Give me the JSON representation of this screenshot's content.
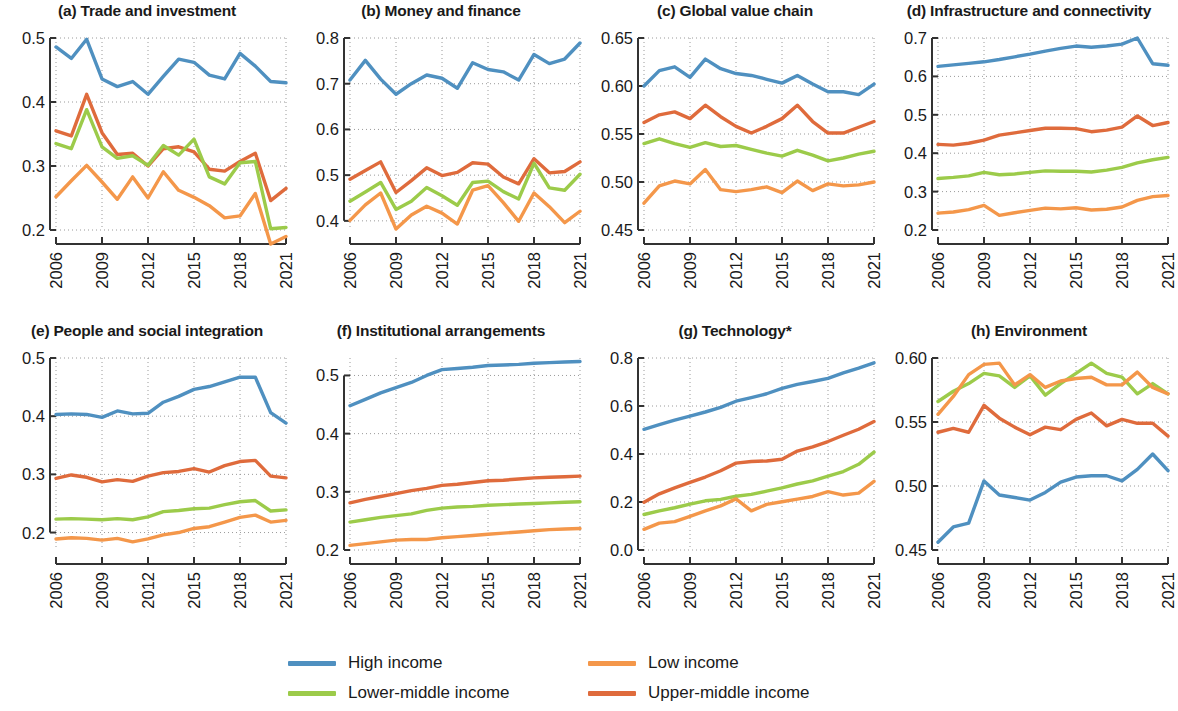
{
  "figure": {
    "background": "#ffffff",
    "x_ticks": [
      "2006",
      "2009",
      "2012",
      "2015",
      "2018",
      "2021"
    ],
    "years": [
      2006,
      2007,
      2008,
      2009,
      2010,
      2011,
      2012,
      2013,
      2014,
      2015,
      2016,
      2017,
      2018,
      2019,
      2020,
      2021
    ]
  },
  "legend": {
    "position": "bottom-center",
    "items": [
      {
        "label": "High income",
        "color": "#4f90c0"
      },
      {
        "label": "Low income",
        "color": "#f4974a"
      },
      {
        "label": "Lower-middle income",
        "color": "#9ccb4a"
      },
      {
        "label": "Upper-middle income",
        "color": "#df6b3c"
      }
    ]
  },
  "colors": {
    "high_income": "#4f90c0",
    "low_income": "#f4974a",
    "lower_middle_income": "#9ccb4a",
    "upper_middle_income": "#df6b3c",
    "axis": "#333333",
    "grid": "#9a9a9a"
  },
  "chart_data": [
    {
      "type": "line",
      "panel": "a",
      "title": "(a) Trade and investment",
      "xlabel": "",
      "ylabel": "",
      "x": [
        2006,
        2007,
        2008,
        2009,
        2010,
        2011,
        2012,
        2013,
        2014,
        2015,
        2016,
        2017,
        2018,
        2019,
        2020,
        2021
      ],
      "ylim": [
        0.2,
        0.5
      ],
      "yticks": [
        0.2,
        0.3,
        0.4,
        0.5
      ],
      "ytick_labels": [
        "0.2",
        "0.3",
        "0.4",
        "0.5"
      ],
      "grid": true,
      "series": [
        {
          "name": "High income",
          "color": "#4f90c0",
          "values": [
            0.486,
            0.468,
            0.498,
            0.436,
            0.424,
            0.432,
            0.412,
            0.44,
            0.467,
            0.462,
            0.442,
            0.436,
            0.476,
            0.456,
            0.432,
            0.43
          ]
        },
        {
          "name": "Upper-middle income",
          "color": "#df6b3c",
          "values": [
            0.355,
            0.347,
            0.412,
            0.352,
            0.318,
            0.32,
            0.3,
            0.327,
            0.33,
            0.322,
            0.295,
            0.292,
            0.307,
            0.32,
            0.246,
            0.265
          ]
        },
        {
          "name": "Lower-middle income",
          "color": "#9ccb4a",
          "values": [
            0.335,
            0.327,
            0.388,
            0.33,
            0.312,
            0.316,
            0.301,
            0.332,
            0.317,
            0.342,
            0.283,
            0.272,
            0.305,
            0.307,
            0.202,
            0.204
          ]
        },
        {
          "name": "Low income",
          "color": "#f4974a",
          "values": [
            0.252,
            0.277,
            0.301,
            0.275,
            0.248,
            0.283,
            0.25,
            0.291,
            0.262,
            0.251,
            0.238,
            0.219,
            0.222,
            0.257,
            0.178,
            0.19
          ]
        }
      ]
    },
    {
      "type": "line",
      "panel": "b",
      "title": "(b) Money and finance",
      "xlabel": "",
      "ylabel": "",
      "x": [
        2006,
        2007,
        2008,
        2009,
        2010,
        2011,
        2012,
        2013,
        2014,
        2015,
        2016,
        2017,
        2018,
        2019,
        2020,
        2021
      ],
      "ylim": [
        0.38,
        0.8
      ],
      "yticks": [
        0.4,
        0.5,
        0.6,
        0.7,
        0.8
      ],
      "ytick_labels": [
        "0.4",
        "0.5",
        "0.6",
        "0.7",
        "0.8"
      ],
      "grid": true,
      "series": [
        {
          "name": "High income",
          "color": "#4f90c0",
          "values": [
            0.708,
            0.751,
            0.71,
            0.677,
            0.7,
            0.719,
            0.712,
            0.69,
            0.746,
            0.731,
            0.726,
            0.708,
            0.764,
            0.744,
            0.754,
            0.789
          ]
        },
        {
          "name": "Upper-middle income",
          "color": "#df6b3c",
          "values": [
            0.491,
            0.51,
            0.529,
            0.462,
            0.488,
            0.516,
            0.499,
            0.506,
            0.527,
            0.524,
            0.496,
            0.481,
            0.536,
            0.505,
            0.508,
            0.529
          ]
        },
        {
          "name": "Lower-middle income",
          "color": "#9ccb4a",
          "values": [
            0.443,
            0.463,
            0.484,
            0.425,
            0.443,
            0.473,
            0.455,
            0.434,
            0.484,
            0.487,
            0.464,
            0.448,
            0.526,
            0.472,
            0.467,
            0.502
          ]
        },
        {
          "name": "Low income",
          "color": "#f4974a",
          "values": [
            0.401,
            0.435,
            0.461,
            0.382,
            0.413,
            0.432,
            0.417,
            0.393,
            0.467,
            0.477,
            0.44,
            0.399,
            0.461,
            0.431,
            0.396,
            0.421
          ]
        }
      ]
    },
    {
      "type": "line",
      "panel": "c",
      "title": "(c) Global value chain",
      "xlabel": "",
      "ylabel": "",
      "x": [
        2006,
        2007,
        2008,
        2009,
        2010,
        2011,
        2012,
        2013,
        2014,
        2015,
        2016,
        2017,
        2018,
        2019,
        2020,
        2021
      ],
      "ylim": [
        0.45,
        0.65
      ],
      "yticks": [
        0.45,
        0.5,
        0.55,
        0.6,
        0.65
      ],
      "ytick_labels": [
        "0.45",
        "0.50",
        "0.55",
        "0.60",
        "0.65"
      ],
      "grid": true,
      "series": [
        {
          "name": "High income",
          "color": "#4f90c0",
          "values": [
            0.6,
            0.616,
            0.62,
            0.609,
            0.628,
            0.618,
            0.613,
            0.611,
            0.607,
            0.603,
            0.611,
            0.602,
            0.594,
            0.594,
            0.591,
            0.602
          ]
        },
        {
          "name": "Upper-middle income",
          "color": "#df6b3c",
          "values": [
            0.562,
            0.57,
            0.573,
            0.566,
            0.58,
            0.568,
            0.558,
            0.551,
            0.558,
            0.566,
            0.58,
            0.563,
            0.551,
            0.551,
            0.557,
            0.563
          ]
        },
        {
          "name": "Lower-middle income",
          "color": "#9ccb4a",
          "values": [
            0.54,
            0.545,
            0.54,
            0.536,
            0.541,
            0.537,
            0.538,
            0.534,
            0.53,
            0.527,
            0.533,
            0.528,
            0.522,
            0.525,
            0.529,
            0.532
          ]
        },
        {
          "name": "Low income",
          "color": "#f4974a",
          "values": [
            0.478,
            0.496,
            0.501,
            0.498,
            0.513,
            0.492,
            0.49,
            0.492,
            0.495,
            0.489,
            0.501,
            0.491,
            0.498,
            0.496,
            0.497,
            0.5
          ]
        }
      ]
    },
    {
      "type": "line",
      "panel": "d",
      "title": "(d) Infrastructure and connectivity",
      "xlabel": "",
      "ylabel": "",
      "x": [
        2006,
        2007,
        2008,
        2009,
        2010,
        2011,
        2012,
        2013,
        2014,
        2015,
        2016,
        2017,
        2018,
        2019,
        2020,
        2021
      ],
      "ylim": [
        0.2,
        0.7
      ],
      "yticks": [
        0.2,
        0.3,
        0.4,
        0.5,
        0.6,
        0.7
      ],
      "ytick_labels": [
        "0.2",
        "0.3",
        "0.4",
        "0.5",
        "0.6",
        "0.7"
      ],
      "grid": true,
      "series": [
        {
          "name": "High income",
          "color": "#4f90c0",
          "values": [
            0.626,
            0.63,
            0.634,
            0.638,
            0.644,
            0.651,
            0.658,
            0.666,
            0.673,
            0.679,
            0.676,
            0.679,
            0.684,
            0.7,
            0.633,
            0.629
          ]
        },
        {
          "name": "Upper-middle income",
          "color": "#df6b3c",
          "values": [
            0.423,
            0.421,
            0.426,
            0.434,
            0.447,
            0.453,
            0.459,
            0.465,
            0.465,
            0.464,
            0.456,
            0.46,
            0.468,
            0.497,
            0.472,
            0.48
          ]
        },
        {
          "name": "Lower-middle income",
          "color": "#9ccb4a",
          "values": [
            0.334,
            0.337,
            0.341,
            0.35,
            0.344,
            0.346,
            0.35,
            0.354,
            0.353,
            0.353,
            0.351,
            0.356,
            0.363,
            0.375,
            0.383,
            0.389
          ]
        },
        {
          "name": "Low income",
          "color": "#f4974a",
          "values": [
            0.244,
            0.247,
            0.253,
            0.264,
            0.238,
            0.245,
            0.251,
            0.257,
            0.255,
            0.258,
            0.252,
            0.254,
            0.26,
            0.277,
            0.287,
            0.29
          ]
        }
      ]
    },
    {
      "type": "line",
      "panel": "e",
      "title": "(e) People and social integration",
      "xlabel": "",
      "ylabel": "",
      "x": [
        2006,
        2007,
        2008,
        2009,
        2010,
        2011,
        2012,
        2013,
        2014,
        2015,
        2016,
        2017,
        2018,
        2019,
        2020,
        2021
      ],
      "ylim": [
        0.17,
        0.5
      ],
      "yticks": [
        0.2,
        0.3,
        0.4,
        0.5
      ],
      "ytick_labels": [
        "0.2",
        "0.3",
        "0.4",
        "0.5"
      ],
      "grid": true,
      "series": [
        {
          "name": "High income",
          "color": "#4f90c0",
          "values": [
            0.403,
            0.404,
            0.403,
            0.398,
            0.409,
            0.404,
            0.405,
            0.424,
            0.434,
            0.446,
            0.451,
            0.459,
            0.467,
            0.467,
            0.406,
            0.388
          ]
        },
        {
          "name": "Upper-middle income",
          "color": "#df6b3c",
          "values": [
            0.293,
            0.299,
            0.295,
            0.287,
            0.291,
            0.288,
            0.297,
            0.303,
            0.305,
            0.31,
            0.304,
            0.315,
            0.322,
            0.324,
            0.297,
            0.294
          ]
        },
        {
          "name": "Lower-middle income",
          "color": "#9ccb4a",
          "values": [
            0.223,
            0.224,
            0.223,
            0.222,
            0.224,
            0.222,
            0.227,
            0.236,
            0.238,
            0.241,
            0.242,
            0.248,
            0.253,
            0.255,
            0.237,
            0.239
          ]
        },
        {
          "name": "Low income",
          "color": "#f4974a",
          "values": [
            0.189,
            0.191,
            0.19,
            0.187,
            0.19,
            0.184,
            0.189,
            0.196,
            0.2,
            0.207,
            0.21,
            0.218,
            0.226,
            0.23,
            0.218,
            0.221
          ]
        }
      ]
    },
    {
      "type": "line",
      "panel": "f",
      "title": "(f) Institutional arrangements",
      "xlabel": "",
      "ylabel": "",
      "x": [
        2006,
        2007,
        2008,
        2009,
        2010,
        2011,
        2012,
        2013,
        2014,
        2015,
        2016,
        2017,
        2018,
        2019,
        2020,
        2021
      ],
      "ylim": [
        0.2,
        0.53
      ],
      "yticks": [
        0.2,
        0.3,
        0.4,
        0.5
      ],
      "ytick_labels": [
        "0.2",
        "0.3",
        "0.4",
        "0.5"
      ],
      "grid": true,
      "series": [
        {
          "name": "High income",
          "color": "#4f90c0",
          "values": [
            0.448,
            0.459,
            0.47,
            0.479,
            0.488,
            0.5,
            0.51,
            0.512,
            0.514,
            0.517,
            0.518,
            0.519,
            0.521,
            0.522,
            0.523,
            0.524
          ]
        },
        {
          "name": "Upper-middle income",
          "color": "#df6b3c",
          "values": [
            0.281,
            0.287,
            0.292,
            0.297,
            0.302,
            0.306,
            0.311,
            0.313,
            0.316,
            0.319,
            0.32,
            0.322,
            0.324,
            0.325,
            0.326,
            0.327
          ]
        },
        {
          "name": "Lower-middle income",
          "color": "#9ccb4a",
          "values": [
            0.248,
            0.252,
            0.256,
            0.259,
            0.262,
            0.268,
            0.272,
            0.274,
            0.275,
            0.277,
            0.278,
            0.279,
            0.28,
            0.281,
            0.282,
            0.283
          ]
        },
        {
          "name": "Low income",
          "color": "#f4974a",
          "values": [
            0.208,
            0.211,
            0.214,
            0.217,
            0.218,
            0.218,
            0.221,
            0.223,
            0.225,
            0.227,
            0.229,
            0.231,
            0.233,
            0.235,
            0.236,
            0.237
          ]
        }
      ]
    },
    {
      "type": "line",
      "panel": "g",
      "title": "(g) Technology*",
      "xlabel": "",
      "ylabel": "",
      "x": [
        2006,
        2007,
        2008,
        2009,
        2010,
        2011,
        2012,
        2013,
        2014,
        2015,
        2016,
        2017,
        2018,
        2019,
        2020,
        2021
      ],
      "ylim": [
        0.0,
        0.8
      ],
      "yticks": [
        0.0,
        0.2,
        0.4,
        0.6,
        0.8
      ],
      "ytick_labels": [
        "0.0",
        "0.2",
        "0.4",
        "0.6",
        "0.8"
      ],
      "grid": true,
      "series": [
        {
          "name": "High income",
          "color": "#4f90c0",
          "values": [
            0.503,
            0.522,
            0.541,
            0.558,
            0.575,
            0.594,
            0.62,
            0.635,
            0.651,
            0.673,
            0.69,
            0.702,
            0.715,
            0.738,
            0.758,
            0.78
          ]
        },
        {
          "name": "Upper-middle income",
          "color": "#df6b3c",
          "values": [
            0.199,
            0.234,
            0.259,
            0.282,
            0.304,
            0.33,
            0.362,
            0.369,
            0.371,
            0.378,
            0.412,
            0.43,
            0.452,
            0.478,
            0.503,
            0.535
          ]
        },
        {
          "name": "Lower-middle income",
          "color": "#9ccb4a",
          "values": [
            0.148,
            0.163,
            0.176,
            0.191,
            0.205,
            0.211,
            0.224,
            0.232,
            0.245,
            0.259,
            0.275,
            0.288,
            0.308,
            0.327,
            0.357,
            0.408
          ]
        },
        {
          "name": "Low income",
          "color": "#f4974a",
          "values": [
            0.086,
            0.112,
            0.118,
            0.14,
            0.163,
            0.184,
            0.213,
            0.163,
            0.19,
            0.201,
            0.212,
            0.223,
            0.243,
            0.229,
            0.237,
            0.286
          ]
        }
      ]
    },
    {
      "type": "line",
      "panel": "h",
      "title": "(h) Environment",
      "xlabel": "",
      "ylabel": "",
      "x": [
        2006,
        2007,
        2008,
        2009,
        2010,
        2011,
        2012,
        2013,
        2014,
        2015,
        2016,
        2017,
        2018,
        2019,
        2020,
        2021
      ],
      "ylim": [
        0.45,
        0.6
      ],
      "yticks": [
        0.45,
        0.5,
        0.55,
        0.6
      ],
      "ytick_labels": [
        "0.45",
        "0.50",
        "0.55",
        "0.60"
      ],
      "grid": true,
      "series": [
        {
          "name": "Lower-middle income",
          "color": "#9ccb4a",
          "values": [
            0.566,
            0.574,
            0.58,
            0.588,
            0.586,
            0.577,
            0.586,
            0.571,
            0.58,
            0.588,
            0.596,
            0.588,
            0.585,
            0.572,
            0.58,
            0.572
          ]
        },
        {
          "name": "Low income",
          "color": "#f4974a",
          "values": [
            0.556,
            0.57,
            0.587,
            0.595,
            0.596,
            0.579,
            0.587,
            0.577,
            0.582,
            0.584,
            0.585,
            0.579,
            0.579,
            0.589,
            0.577,
            0.572
          ]
        },
        {
          "name": "Upper-middle income",
          "color": "#df6b3c",
          "values": [
            0.542,
            0.545,
            0.542,
            0.563,
            0.553,
            0.546,
            0.54,
            0.546,
            0.544,
            0.552,
            0.557,
            0.547,
            0.552,
            0.549,
            0.549,
            0.539
          ]
        },
        {
          "name": "High income",
          "color": "#4f90c0",
          "values": [
            0.456,
            0.468,
            0.471,
            0.504,
            0.493,
            0.491,
            0.489,
            0.495,
            0.503,
            0.507,
            0.508,
            0.508,
            0.504,
            0.513,
            0.525,
            0.512
          ]
        }
      ]
    }
  ]
}
